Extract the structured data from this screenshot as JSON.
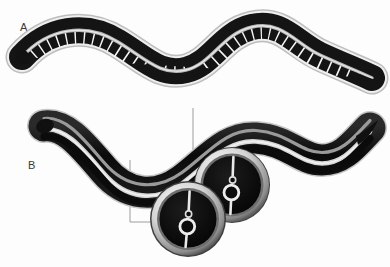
{
  "figure": {
    "background_color": "#fdfdfd",
    "width": 390,
    "height": 267
  },
  "panels": [
    {
      "id": "panel-a",
      "label": "A",
      "label_x": 20,
      "label_y": 31,
      "description": "Whole nematode, sinusoidal body posture, annulated / segmented cuticle surface rendered as dark blocks separated by pale transverse bands with a pale longitudinal midline stripe",
      "body_color": "#111111",
      "band_color": "#f2f2f2",
      "midline_color": "#b9b9b9",
      "outline_color": "#9a9a9a",
      "segment_count": 34
    },
    {
      "id": "panel-b",
      "label": "B",
      "label_x": 28,
      "label_y": 169,
      "description": "Whole nematode, smooth glossy cuticle with two longitudinal specular highlight stripes, drawn with two transverse cross-section insets",
      "body_color": "#0d0d0d",
      "highlight_color": "#cfcfcf",
      "secondary_highlight_color": "#8f8f8f"
    }
  ],
  "cross_sections": [
    {
      "id": "cross-section-posterior",
      "name": "posterior-cross-section",
      "center_x": 232,
      "center_y": 185,
      "outer_radius": 38,
      "ring_color": "#d9d9d9",
      "lumen_color": "#0b0b0b",
      "features": [
        "cuticle ring",
        "hypodermis",
        "intestinal lumen ring",
        "dorsal nerve cord dot",
        "dorsal ray",
        "ventral ray"
      ]
    },
    {
      "id": "cross-section-anterior",
      "name": "anterior-cross-section",
      "center_x": 188,
      "center_y": 219,
      "outer_radius": 37,
      "ring_color": "#d9d9d9",
      "lumen_color": "#0b0b0b",
      "features": [
        "cuticle ring",
        "hypodermis",
        "intestinal lumen ring",
        "dorsal nerve cord dot",
        "dorsal ray",
        "ventral ray"
      ]
    }
  ],
  "leader_lines": [
    {
      "id": "leader-posterior",
      "name": "leader-line-posterior",
      "color": "#9d9d9d",
      "points": "193,108 193,170 205,170"
    },
    {
      "id": "leader-anterior",
      "name": "leader-line-anterior",
      "color": "#9d9d9d",
      "points": "130,160 130,222 152,222"
    }
  ],
  "colors": {
    "ink": "#0d0d0d",
    "highlight": "#d4d4d4",
    "midtone": "#8f8f8f",
    "leader": "#9d9d9d",
    "label": "#3a3a3a",
    "paper": "#fdfdfd"
  }
}
